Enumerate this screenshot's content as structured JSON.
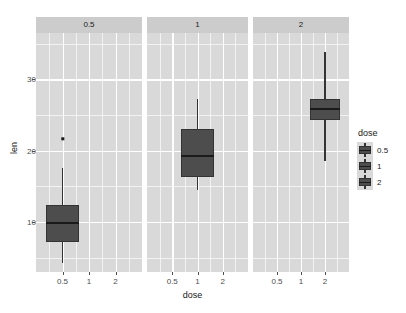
{
  "chart_data": {
    "type": "box",
    "title": "",
    "xlabel": "dose",
    "ylabel": "len",
    "ylim": [
      3.0,
      36.5
    ],
    "y_ticks": [
      10,
      20,
      30
    ],
    "y_minor_ticks": [
      5,
      15,
      25,
      35
    ],
    "x_categories": [
      "0.5",
      "1",
      "2"
    ],
    "grid": true,
    "legend": {
      "title": "dose",
      "position": "right",
      "entries": [
        "0.5",
        "1",
        "2"
      ]
    },
    "facet_variable": "dose",
    "facets": [
      {
        "strip_label": "0.5",
        "boxes": [
          {
            "category": "0.5",
            "lower_whisker": 4.2,
            "q1": 7.2,
            "median": 9.9,
            "q3": 12.4,
            "upper_whisker": 17.6,
            "outliers": [
              21.7
            ]
          }
        ]
      },
      {
        "strip_label": "1",
        "boxes": [
          {
            "category": "1",
            "lower_whisker": 14.5,
            "q1": 16.3,
            "median": 19.3,
            "q3": 23.1,
            "upper_whisker": 27.3,
            "outliers": []
          }
        ]
      },
      {
        "strip_label": "2",
        "boxes": [
          {
            "category": "2",
            "lower_whisker": 18.5,
            "q1": 24.3,
            "median": 25.9,
            "q3": 27.3,
            "upper_whisker": 33.9,
            "outliers": []
          }
        ]
      }
    ],
    "colors": {
      "panel_background": "#d9d9d9",
      "strip_background": "#cccccc",
      "grid_line": "#ffffff",
      "box_fill": "#4d4d4d",
      "box_border": "#333333",
      "median_line": "#1a1a1a",
      "text": "#1a1a1a",
      "tick_text": "#4d4d4d",
      "plot_background": "#ffffff"
    }
  }
}
